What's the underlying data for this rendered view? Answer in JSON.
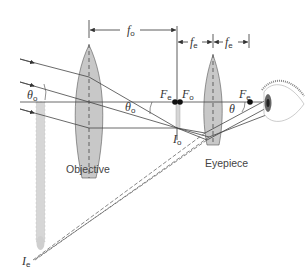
{
  "diagram": {
    "lenses": [
      {
        "id": "objective",
        "label": "Objective"
      },
      {
        "id": "eyepiece",
        "label": "Eyepiece"
      }
    ],
    "dimensions": {
      "f_objective": {
        "symbol": "f",
        "sub": "o"
      },
      "f_eyepiece_left": {
        "symbol": "f",
        "sub": "e"
      },
      "f_eyepiece_right": {
        "symbol": "f",
        "sub": "e"
      }
    },
    "focal_points": {
      "Fe_left": {
        "symbol": "F",
        "sub": "e"
      },
      "Fo": {
        "symbol": "F",
        "sub": "o"
      },
      "Fe_right": {
        "symbol": "F",
        "sub": "e"
      }
    },
    "angles": {
      "theta_o_left": {
        "symbol": "θ",
        "sub": "o"
      },
      "theta_o_mid": {
        "symbol": "θ",
        "sub": "o"
      },
      "theta": {
        "symbol": "θ",
        "sub": ""
      }
    },
    "images": {
      "Io": {
        "symbol": "I",
        "sub": "o"
      },
      "Ie": {
        "symbol": "I",
        "sub": "e"
      }
    },
    "colors": {
      "lens_fill": "#c8c8c8",
      "ray": "#444444",
      "image_bar": "#d6d6d6",
      "dot": "#111111"
    }
  }
}
